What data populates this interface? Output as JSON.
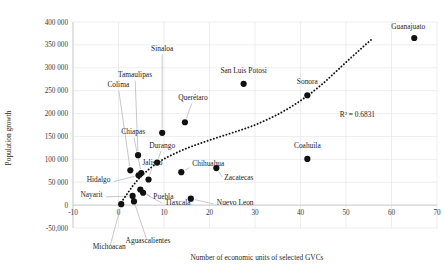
{
  "chart_data": {
    "type": "scatter",
    "title": "",
    "xlabel": "Number of economic units of selected GVCs",
    "ylabel": "Population growth",
    "xlim": [
      -10,
      70
    ],
    "ylim": [
      -50000,
      400000
    ],
    "xticks": [
      -10,
      0,
      10,
      20,
      30,
      40,
      50,
      60,
      70
    ],
    "xticklabels": [
      "-10",
      "0",
      "10",
      "20",
      "30",
      "40",
      "50",
      "60",
      "70"
    ],
    "yticks": [
      -50000,
      0,
      50000,
      100000,
      150000,
      200000,
      250000,
      300000,
      350000,
      400000
    ],
    "yticklabels": [
      "-50,000",
      "0",
      "50 000",
      "100 000",
      "150 000",
      "200 000",
      "250 000",
      "300 000",
      "350 000",
      "400 000"
    ],
    "grid": true,
    "legend": false,
    "annotations": [
      {
        "name": "r-squared",
        "text": "R² = 0.6831",
        "x": 52.5,
        "y": 192000
      }
    ],
    "trendline": {
      "type": "exponential",
      "style": "dotted",
      "r_squared": 0.6831,
      "r_squared_label": "R² = 0.6831",
      "points": [
        [
          0.6,
          6000
        ],
        [
          2.0,
          26000
        ],
        [
          3.2,
          43000
        ],
        [
          4.4,
          57000
        ],
        [
          5.6,
          69000
        ],
        [
          7.0,
          81000
        ],
        [
          8.5,
          92000
        ],
        [
          10.0,
          101000
        ],
        [
          12.0,
          111000
        ],
        [
          14.0,
          120000
        ],
        [
          16.0,
          128000
        ],
        [
          18.0,
          135000
        ],
        [
          20.0,
          142000
        ],
        [
          22.5,
          150000
        ],
        [
          25.0,
          158000
        ],
        [
          27.5,
          166000
        ],
        [
          30.0,
          175000
        ],
        [
          32.5,
          186000
        ],
        [
          35.0,
          198000
        ],
        [
          37.5,
          212000
        ],
        [
          40.0,
          228000
        ],
        [
          42.5,
          246000
        ],
        [
          45.0,
          266000
        ],
        [
          47.5,
          289000
        ],
        [
          50.0,
          312000
        ],
        [
          52.0,
          330000
        ],
        [
          54.0,
          348000
        ],
        [
          55.5,
          361000
        ]
      ]
    },
    "points": [
      {
        "label": "Guanajuato",
        "x": 65.0,
        "y": 365000,
        "label_dx": -6,
        "label_dy": -9,
        "leader": false,
        "anchor": "middle"
      },
      {
        "label": "San Luis Potosi",
        "x": 27.5,
        "y": 265000,
        "label_dx": 0,
        "label_dy": -11,
        "leader": false,
        "anchor": "middle"
      },
      {
        "label": "Sonora",
        "x": 41.5,
        "y": 240000,
        "label_dx": 0,
        "label_dy": -11,
        "leader": false,
        "anchor": "middle"
      },
      {
        "label": "Sinaloa",
        "x": 9.6,
        "y": 158000,
        "label_dx": 0,
        "label_dy": -82,
        "leader": true,
        "anchor": "middle"
      },
      {
        "label": "Querétaro",
        "x": 14.6,
        "y": 181000,
        "label_dx": 8,
        "label_dy": -22,
        "leader": true,
        "anchor": "middle"
      },
      {
        "label": "Tamaulipas",
        "x": 4.3,
        "y": 109000,
        "label_dx": -3,
        "label_dy": -78,
        "leader": true,
        "anchor": "middle"
      },
      {
        "label": "Colima",
        "x": 2.6,
        "y": 76000,
        "label_dx": -12,
        "label_dy": -83,
        "leader": true,
        "anchor": "middle"
      },
      {
        "label": "Chiapas",
        "x": 5.0,
        "y": 70000,
        "label_dx": -8,
        "label_dy": -39,
        "leader": true,
        "anchor": "middle"
      },
      {
        "label": "Jalisco",
        "x": 6.6,
        "y": 56000,
        "label_dx": 4,
        "label_dy": -14,
        "leader": true,
        "anchor": "middle"
      },
      {
        "label": "Durango",
        "x": 8.5,
        "y": 93000,
        "label_dx": 5,
        "label_dy": -15,
        "leader": true,
        "anchor": "middle"
      },
      {
        "label": "Chihuahua",
        "x": 13.8,
        "y": 72000,
        "label_dx": 11,
        "label_dy": -6,
        "leader": true,
        "anchor": "start"
      },
      {
        "label": "Coahuila",
        "x": 41.5,
        "y": 101000,
        "label_dx": 0,
        "label_dy": -11,
        "leader": false,
        "anchor": "middle"
      },
      {
        "label": "Zacatecas",
        "x": 21.5,
        "y": 81000,
        "label_dx": 8,
        "label_dy": 12,
        "leader": true,
        "anchor": "start"
      },
      {
        "label": "Hidalgo",
        "x": 4.4,
        "y": 65000,
        "label_dx": -28,
        "label_dy": 7,
        "leader": true,
        "anchor": "end"
      },
      {
        "label": "Puebla",
        "x": 4.8,
        "y": 34000,
        "label_dx": 13,
        "label_dy": 9,
        "leader": true,
        "anchor": "start"
      },
      {
        "label": "Tlaxcala",
        "x": 5.4,
        "y": 27000,
        "label_dx": 22,
        "label_dy": 12,
        "leader": true,
        "anchor": "start"
      },
      {
        "label": "Nuevo Leon",
        "x": 15.9,
        "y": 14000,
        "label_dx": 26,
        "label_dy": 6,
        "leader": true,
        "anchor": "start"
      },
      {
        "label": "Nayarit",
        "x": 3.1,
        "y": 20000,
        "label_dx": -30,
        "label_dy": 1,
        "leader": true,
        "anchor": "end"
      },
      {
        "label": "Aguascalientes",
        "x": 3.4,
        "y": 8000,
        "label_dx": 14,
        "label_dy": 42,
        "leader": true,
        "anchor": "middle"
      },
      {
        "label": "Michoacan",
        "x": 0.6,
        "y": 2000,
        "label_dx": -12,
        "label_dy": 45,
        "leader": true,
        "anchor": "middle"
      }
    ]
  }
}
